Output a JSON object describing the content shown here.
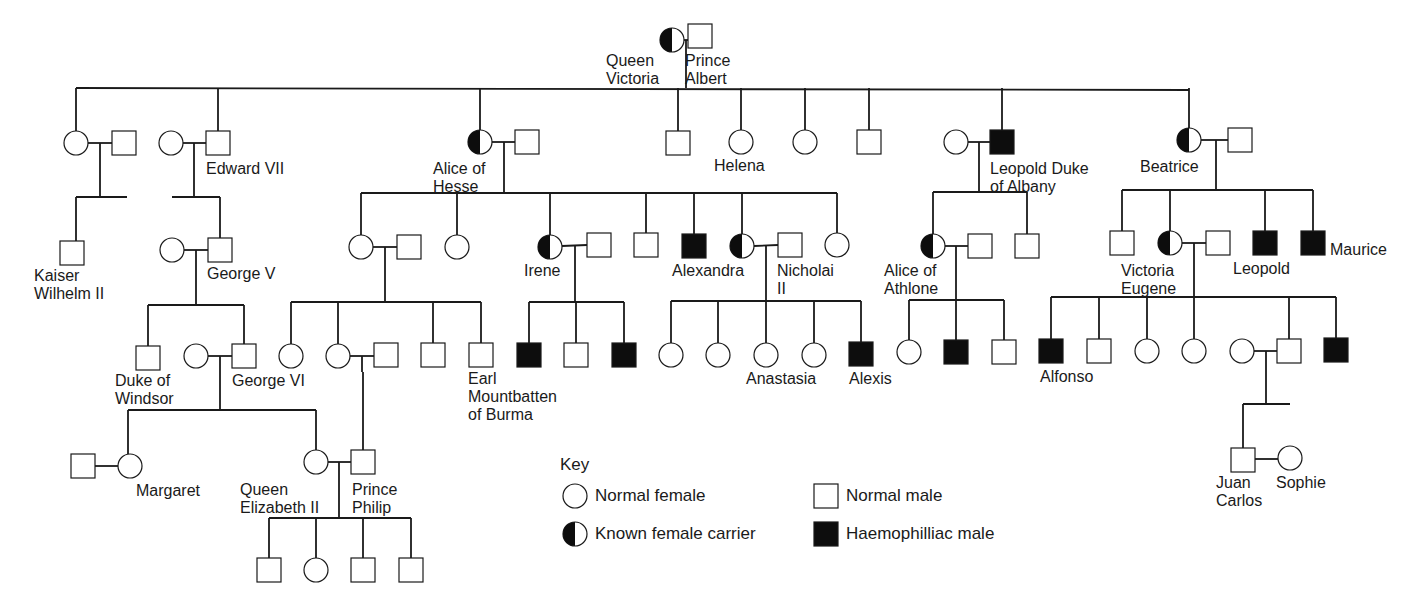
{
  "colors": {
    "line": "#1a1a1a",
    "fill_affected": "#0d0d0d",
    "fill_normal": "#ffffff"
  },
  "people": [
    {
      "id": "victoria",
      "sex": "F",
      "status": "carrier",
      "label": "Queen\nVictoria"
    },
    {
      "id": "albert",
      "sex": "M",
      "status": "normal",
      "label": "Prince\nAlbert"
    },
    {
      "id": "g1_d1",
      "sex": "F",
      "status": "normal",
      "label": ""
    },
    {
      "id": "g1_d1_sp",
      "sex": "M",
      "status": "normal",
      "label": ""
    },
    {
      "id": "kaiser",
      "sex": "M",
      "status": "normal",
      "label": "Kaiser\nWilhelm II"
    },
    {
      "id": "edward7_sp",
      "sex": "F",
      "status": "normal",
      "label": ""
    },
    {
      "id": "edward7",
      "sex": "M",
      "status": "normal",
      "label": "Edward VII"
    },
    {
      "id": "george5_sp",
      "sex": "F",
      "status": "normal",
      "label": ""
    },
    {
      "id": "george5",
      "sex": "M",
      "status": "normal",
      "label": "George V"
    },
    {
      "id": "windsor",
      "sex": "M",
      "status": "normal",
      "label": "Duke of\nWindsor"
    },
    {
      "id": "george6_sp",
      "sex": "F",
      "status": "normal",
      "label": ""
    },
    {
      "id": "george6",
      "sex": "M",
      "status": "normal",
      "label": "George VI"
    },
    {
      "id": "margaret_sp",
      "sex": "M",
      "status": "normal",
      "label": ""
    },
    {
      "id": "margaret",
      "sex": "F",
      "status": "normal",
      "label": "Margaret"
    },
    {
      "id": "elizabeth2",
      "sex": "F",
      "status": "normal",
      "label": "Queen\nElizabeth II"
    },
    {
      "id": "philip",
      "sex": "M",
      "status": "normal",
      "label": "Prince\nPhilip"
    },
    {
      "id": "e2_c1",
      "sex": "M",
      "status": "normal",
      "label": ""
    },
    {
      "id": "e2_c2",
      "sex": "F",
      "status": "normal",
      "label": ""
    },
    {
      "id": "e2_c3",
      "sex": "M",
      "status": "normal",
      "label": ""
    },
    {
      "id": "e2_c4",
      "sex": "M",
      "status": "normal",
      "label": ""
    },
    {
      "id": "alice_hesse",
      "sex": "F",
      "status": "carrier",
      "label": "Alice of\nHesse"
    },
    {
      "id": "alice_hesse_sp",
      "sex": "M",
      "status": "normal",
      "label": ""
    },
    {
      "id": "ah_d1",
      "sex": "F",
      "status": "normal",
      "label": ""
    },
    {
      "id": "ah_d1_sp",
      "sex": "M",
      "status": "normal",
      "label": ""
    },
    {
      "id": "ah_d2",
      "sex": "F",
      "status": "normal",
      "label": ""
    },
    {
      "id": "ahd1_c1",
      "sex": "F",
      "status": "normal",
      "label": ""
    },
    {
      "id": "ahd1_c2",
      "sex": "F",
      "status": "normal",
      "label": ""
    },
    {
      "id": "ahd1_c2_sp",
      "sex": "M",
      "status": "normal",
      "label": ""
    },
    {
      "id": "ahd1_c3",
      "sex": "M",
      "status": "normal",
      "label": ""
    },
    {
      "id": "mountbatten",
      "sex": "M",
      "status": "normal",
      "label": "Earl\nMountbatten\nof Burma"
    },
    {
      "id": "irene",
      "sex": "F",
      "status": "carrier",
      "label": "Irene"
    },
    {
      "id": "irene_sp",
      "sex": "M",
      "status": "normal",
      "label": ""
    },
    {
      "id": "irene_c1",
      "sex": "M",
      "status": "affected",
      "label": ""
    },
    {
      "id": "irene_c2",
      "sex": "M",
      "status": "normal",
      "label": ""
    },
    {
      "id": "irene_c3",
      "sex": "M",
      "status": "affected",
      "label": ""
    },
    {
      "id": "ah_s1",
      "sex": "M",
      "status": "normal",
      "label": ""
    },
    {
      "id": "ah_s2",
      "sex": "M",
      "status": "affected",
      "label": ""
    },
    {
      "id": "alexandra",
      "sex": "F",
      "status": "carrier",
      "label": "Alexandra"
    },
    {
      "id": "nicholai",
      "sex": "M",
      "status": "normal",
      "label": "Nicholai\nII"
    },
    {
      "id": "ah_d5",
      "sex": "F",
      "status": "normal",
      "label": ""
    },
    {
      "id": "ni_c1",
      "sex": "F",
      "status": "normal",
      "label": ""
    },
    {
      "id": "ni_c2",
      "sex": "F",
      "status": "normal",
      "label": ""
    },
    {
      "id": "anastasia",
      "sex": "F",
      "status": "normal",
      "label": "Anastasia"
    },
    {
      "id": "ni_c4",
      "sex": "F",
      "status": "normal",
      "label": ""
    },
    {
      "id": "alexis",
      "sex": "M",
      "status": "affected",
      "label": "Alexis"
    },
    {
      "id": "v_s2",
      "sex": "M",
      "status": "normal",
      "label": ""
    },
    {
      "id": "helena",
      "sex": "F",
      "status": "normal",
      "label": "Helena"
    },
    {
      "id": "v_d4",
      "sex": "F",
      "status": "normal",
      "label": ""
    },
    {
      "id": "v_s3",
      "sex": "M",
      "status": "normal",
      "label": ""
    },
    {
      "id": "leopold_sp",
      "sex": "F",
      "status": "normal",
      "label": ""
    },
    {
      "id": "leopold_albany",
      "sex": "M",
      "status": "affected",
      "label": "Leopold Duke\nof Albany"
    },
    {
      "id": "alice_athlone",
      "sex": "F",
      "status": "carrier",
      "label": "Alice of\nAthlone"
    },
    {
      "id": "alice_athlone_sp",
      "sex": "M",
      "status": "normal",
      "label": ""
    },
    {
      "id": "la_s1",
      "sex": "M",
      "status": "normal",
      "label": ""
    },
    {
      "id": "aa_c1",
      "sex": "F",
      "status": "normal",
      "label": ""
    },
    {
      "id": "aa_c2",
      "sex": "M",
      "status": "affected",
      "label": ""
    },
    {
      "id": "aa_c3",
      "sex": "M",
      "status": "normal",
      "label": ""
    },
    {
      "id": "beatrice",
      "sex": "F",
      "status": "carrier",
      "label": "Beatrice"
    },
    {
      "id": "beatrice_sp",
      "sex": "M",
      "status": "normal",
      "label": ""
    },
    {
      "id": "b_s1",
      "sex": "M",
      "status": "normal",
      "label": ""
    },
    {
      "id": "victoria_eugene",
      "sex": "F",
      "status": "carrier",
      "label": "Victoria\nEugene"
    },
    {
      "id": "victoria_eugene_sp",
      "sex": "M",
      "status": "normal",
      "label": ""
    },
    {
      "id": "leopold",
      "sex": "M",
      "status": "affected",
      "label": "Leopold"
    },
    {
      "id": "maurice",
      "sex": "M",
      "status": "affected",
      "label": "Maurice"
    },
    {
      "id": "alfonso",
      "sex": "M",
      "status": "affected",
      "label": "Alfonso"
    },
    {
      "id": "ve_c2",
      "sex": "M",
      "status": "normal",
      "label": ""
    },
    {
      "id": "ve_c3",
      "sex": "F",
      "status": "normal",
      "label": ""
    },
    {
      "id": "ve_c4",
      "sex": "F",
      "status": "normal",
      "label": ""
    },
    {
      "id": "ve_c5_sp",
      "sex": "F",
      "status": "normal",
      "label": ""
    },
    {
      "id": "ve_c5",
      "sex": "M",
      "status": "normal",
      "label": ""
    },
    {
      "id": "ve_c6",
      "sex": "M",
      "status": "affected",
      "label": ""
    },
    {
      "id": "juan_carlos",
      "sex": "M",
      "status": "normal",
      "label": "Juan\nCarlos"
    },
    {
      "id": "sophie",
      "sex": "F",
      "status": "normal",
      "label": "Sophie"
    }
  ],
  "key": {
    "title": "Key",
    "items": [
      {
        "sex": "F",
        "status": "normal",
        "label": "Normal female"
      },
      {
        "sex": "M",
        "status": "normal",
        "label": "Normal male"
      },
      {
        "sex": "F",
        "status": "carrier",
        "label": "Known female carrier"
      },
      {
        "sex": "M",
        "status": "affected",
        "label": "Haemophilliac male"
      }
    ]
  }
}
